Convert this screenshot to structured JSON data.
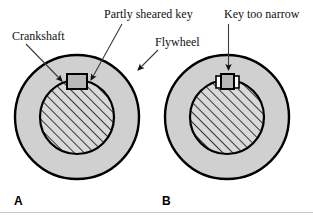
{
  "figure": {
    "kind": "engineering-cross-section-diagram",
    "width": 313,
    "height": 215
  },
  "colors": {
    "page_background": "#ffffff",
    "flywheel_fill": "#d0d0d0",
    "crankshaft_fill": "#d9d9d9",
    "crankshaft_hatch": "#1a1a1a",
    "key_fill": "#b8b8b8",
    "gap_fill": "#ffffff",
    "outline": "#000000",
    "leader_line": "#3a3a4a",
    "text": "#111111",
    "frame": "#c8c8c8"
  },
  "labels": {
    "crankshaft": "Crankshaft",
    "partly_sheared_key": "Partly sheared key",
    "flywheel": "Flywheel",
    "key_too_narrow": "Key too narrow",
    "panel_a": "A",
    "panel_b": "B"
  },
  "panels": [
    {
      "id": "A",
      "label": "A",
      "center": {
        "x": 77,
        "y": 117
      },
      "flywheel_radius": 62,
      "crankshaft_radius": 37,
      "key": {
        "type": "partly-sheared-key",
        "x": 67,
        "y": 74,
        "width": 20,
        "height": 15,
        "fill": "#b8b8b8",
        "notes": "wide key seated in keyway, partly sheared"
      },
      "callouts": [
        "crankshaft",
        "partly_sheared_key",
        "flywheel"
      ]
    },
    {
      "id": "B",
      "label": "B",
      "center": {
        "x": 227,
        "y": 117
      },
      "flywheel_radius": 62,
      "crankshaft_radius": 37,
      "key": {
        "type": "key-too-narrow",
        "x": 221,
        "y": 74,
        "width": 13,
        "height": 15,
        "fill": "#b8b8b8",
        "gap_left": {
          "x": 216,
          "y": 77,
          "width": 5,
          "height": 11
        },
        "gap_right": {
          "x": 234,
          "y": 77,
          "width": 5,
          "height": 11
        },
        "notes": "narrow key leaves clearance gaps on both sides of the keyway"
      },
      "callouts": [
        "key_too_narrow"
      ]
    }
  ],
  "leaders": [
    {
      "name": "crankshaft-leader",
      "label": "Crankshaft",
      "from": {
        "x": 26,
        "y": 44
      },
      "to": {
        "x": 64,
        "y": 83
      },
      "arrow": true
    },
    {
      "name": "partly-sheared-key-leader",
      "label": "Partly sheared key",
      "from": {
        "x": 120,
        "y": 26
      },
      "to": {
        "x": 89,
        "y": 82
      },
      "arrow": true
    },
    {
      "name": "flywheel-leader",
      "label": "Flywheel",
      "from": {
        "x": 157,
        "y": 51
      },
      "to": {
        "x": 136,
        "y": 72
      },
      "arrow": true
    },
    {
      "name": "key-too-narrow-leader",
      "label": "Key too narrow",
      "from": {
        "x": 229,
        "y": 26
      },
      "to": {
        "x": 228,
        "y": 72
      },
      "arrow": true
    }
  ],
  "hatching": {
    "angle_deg": 45,
    "direction": "lower-left to upper-right",
    "spacing_px": 7,
    "stroke_width_px": 1.6
  }
}
